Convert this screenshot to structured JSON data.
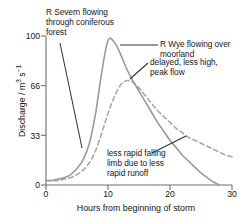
{
  "chart_data": {
    "type": "line",
    "title": "",
    "xlabel": "Hours from beginning of storm",
    "ylabel": "Discharge / m³ s⁻¹",
    "ylabel_parts": {
      "head": "Discharge / m",
      "exp1": "3",
      "mid": " s",
      "exp2": "−1"
    },
    "xlim": [
      0,
      30
    ],
    "ylim": [
      0,
      100
    ],
    "xticks": [
      "0",
      "10",
      "20",
      "30"
    ],
    "yticks": [
      "0",
      "33",
      "66",
      "100"
    ],
    "grid": false,
    "legend_position": "none",
    "series": [
      {
        "name": "R Severn flowing through coniferous forest",
        "style": "solid",
        "color": "#9a9a9a",
        "x": [
          0,
          1,
          2,
          3,
          4,
          5,
          6,
          7,
          8,
          9,
          10,
          11,
          12,
          13,
          14,
          15,
          16,
          17,
          18,
          19,
          20,
          21,
          22,
          23,
          24,
          25,
          26,
          27,
          28
        ],
        "y": [
          3,
          3,
          4,
          5,
          7,
          11,
          17,
          28,
          48,
          76,
          97,
          96,
          88,
          78,
          70,
          63,
          56,
          49,
          42,
          36,
          30,
          25,
          20,
          16,
          12,
          8,
          5,
          2,
          0
        ]
      },
      {
        "name": "R Wye flowing over moorland",
        "style": "dashed",
        "color": "#a8a8a8",
        "x": [
          0,
          1,
          2,
          3,
          4,
          5,
          6,
          7,
          8,
          9,
          10,
          11,
          12,
          13,
          14,
          15,
          16,
          17,
          18,
          19,
          20,
          21,
          22,
          23,
          24,
          25,
          26,
          27,
          28,
          29,
          30
        ],
        "y": [
          3,
          3,
          3,
          4,
          5,
          7,
          10,
          15,
          23,
          35,
          48,
          59,
          67,
          70,
          69,
          65,
          60,
          55,
          50,
          46,
          42,
          38,
          35,
          32,
          30,
          28,
          26,
          24,
          22,
          20,
          19
        ]
      }
    ],
    "annotations": [
      {
        "id": "severn",
        "text": "R Severn flowing\nthrough coniferous\nforest",
        "leader_from": [
          60,
          43
        ],
        "leader_to": [
          82,
          148
        ]
      },
      {
        "id": "wye",
        "text": "R Wye flowing over\nmoorland",
        "leader_from": [
          158,
          45
        ],
        "leader_to": [
          120,
          45
        ]
      },
      {
        "id": "delayed",
        "text": "delayed, less high,\npeak flow",
        "leader_from": [
          148,
          63
        ],
        "leader_to": [
          130,
          79
        ]
      },
      {
        "id": "limb",
        "text": "less rapid falling\nlimb due to less\nrapid runoff",
        "leader_from": [
          186,
          136
        ],
        "leader_to": [
          152,
          153
        ]
      }
    ]
  },
  "axes": {
    "y_tick_100": "100",
    "y_tick_66": "66",
    "y_tick_33": "33",
    "y_tick_0": "0",
    "x_tick_0": "0",
    "x_tick_10": "10",
    "x_tick_20": "20",
    "x_tick_30": "30",
    "x_title": "Hours from beginning of storm",
    "y_title_head": "Discharge / m",
    "y_title_exp1": "3",
    "y_title_mid": " s",
    "y_title_exp2": "−1"
  },
  "annotations": {
    "severn": "R Severn flowing\nthrough coniferous\nforest",
    "wye": "R Wye flowing over\nmoorland",
    "delayed": "delayed, less high,\npeak flow",
    "limb": "less rapid falling\nlimb due to less\nrapid runoff"
  },
  "colors": {
    "curve_solid": "#9a9a9a",
    "curve_dashed": "#a8a8a8",
    "axis": "#6e6e6e",
    "leader": "#333333",
    "text": "#161616"
  }
}
